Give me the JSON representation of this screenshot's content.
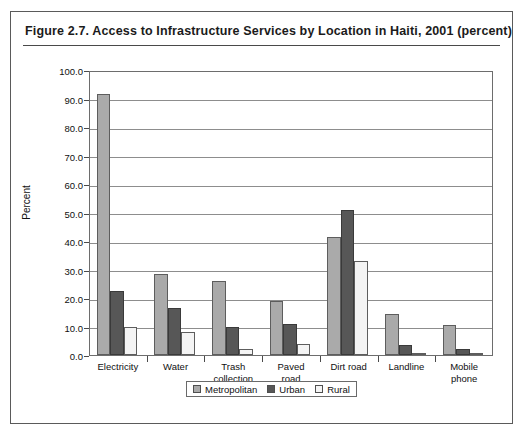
{
  "figure": {
    "title": "Figure 2.7.  Access to Infrastructure Services by Location in Haiti, 2001 (percent)"
  },
  "colors": {
    "metropolitan": "#aaaaaa",
    "urban": "#575757",
    "rural": "#f4f4f4",
    "axis": "#6d6d6d",
    "gridline": "#8d8d8d",
    "frame": "#5a5a5a"
  },
  "chart_data": {
    "type": "bar",
    "title": "Figure 2.7.  Access to Infrastructure Services by Location in Haiti, 2001 (percent)",
    "xlabel": "",
    "ylabel": "Percent",
    "ylim": [
      0,
      100
    ],
    "ytick_labels": [
      "100.0",
      "90.0",
      "80.0",
      "70.0",
      "60.0",
      "50.0",
      "40.0",
      "30.0",
      "20.0",
      "10.0",
      "0.0"
    ],
    "ytick_values": [
      100,
      90,
      80,
      70,
      60,
      50,
      40,
      30,
      20,
      10,
      0
    ],
    "grid": true,
    "legend_position": "bottom",
    "categories": [
      "Electricity",
      "Water",
      "Trash collection",
      "Paved road",
      "Dirt road",
      "Landline",
      "Mobile phone"
    ],
    "category_label_lines": [
      [
        "Electricity"
      ],
      [
        "Water"
      ],
      [
        "Trash",
        "collection"
      ],
      [
        "Paved",
        "road"
      ],
      [
        "Dirt road"
      ],
      [
        "Landline"
      ],
      [
        "Mobile",
        "phone"
      ]
    ],
    "series": [
      {
        "name": "Metropolitan",
        "color": "#aaaaaa",
        "values": [
          91.5,
          28.5,
          26.0,
          19.0,
          41.5,
          14.3,
          10.7
        ]
      },
      {
        "name": "Urban",
        "color": "#575757",
        "values": [
          22.5,
          16.5,
          10.0,
          11.0,
          51.0,
          3.5,
          2.0
        ]
      },
      {
        "name": "Rural",
        "color": "#f4f4f4",
        "values": [
          10.0,
          8.0,
          2.0,
          4.0,
          33.0,
          0.8,
          0.5
        ]
      }
    ]
  },
  "legend": {
    "items": [
      {
        "label": "Metropolitan",
        "color": "#aaaaaa"
      },
      {
        "label": "Urban",
        "color": "#575757"
      },
      {
        "label": "Rural",
        "color": "#f4f4f4"
      }
    ]
  }
}
